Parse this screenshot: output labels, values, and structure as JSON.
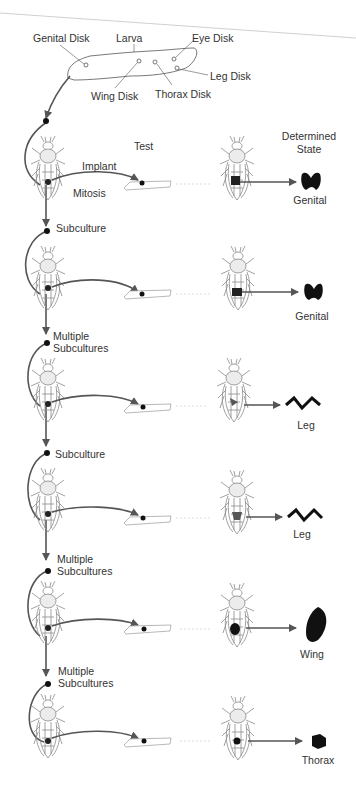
{
  "larva": {
    "label": "Larva",
    "disks": [
      {
        "label": "Genital Disk"
      },
      {
        "label": "Eye Disk"
      },
      {
        "label": "Leg Disk"
      },
      {
        "label": "Wing Disk"
      },
      {
        "label": "Thorax Disk"
      }
    ]
  },
  "column_headers": {
    "test": "Test",
    "determined_state_line1": "Determined",
    "determined_state_line2": "State"
  },
  "process_labels": {
    "implant": "Implant",
    "mitosis": "Mitosis"
  },
  "rows": [
    {
      "transfer_label_1": "",
      "transfer_label_2": "",
      "result": "Genital",
      "result_shape": "genital"
    },
    {
      "transfer_label_1": "Subculture",
      "transfer_label_2": "",
      "result": "Genital",
      "result_shape": "genital"
    },
    {
      "transfer_label_1": "Multiple",
      "transfer_label_2": "Subcultures",
      "result": "Leg",
      "result_shape": "leg"
    },
    {
      "transfer_label_1": "Subculture",
      "transfer_label_2": "",
      "result": "Leg",
      "result_shape": "leg"
    },
    {
      "transfer_label_1": "Multiple",
      "transfer_label_2": "Subcultures",
      "result": "Wing",
      "result_shape": "wing"
    },
    {
      "transfer_label_1": "Multiple",
      "transfer_label_2": "Subcultures",
      "result": "Thorax",
      "result_shape": "thorax"
    }
  ],
  "colors": {
    "arrow": "#555555",
    "line": "#777777",
    "ink": "#111111",
    "fly": "#8a8a8a",
    "dotted": "#c8c8c8"
  }
}
